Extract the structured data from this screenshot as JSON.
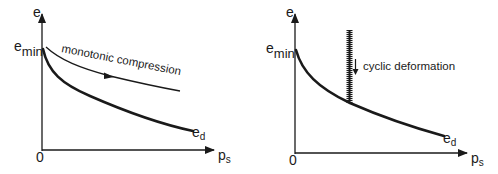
{
  "figure": {
    "panels": [
      {
        "id": "monotonic",
        "y_axis_label": "e",
        "x_axis_label_main": "p",
        "x_axis_label_sub": "s",
        "origin_label": "0",
        "upper_bound_label_main": "e",
        "upper_bound_label_sub": "min",
        "lower_curve_label_main": "e",
        "lower_curve_label_sub": "d",
        "annotation": "monotonic compression"
      },
      {
        "id": "cyclic",
        "y_axis_label": "e",
        "x_axis_label_main": "p",
        "x_axis_label_sub": "s",
        "origin_label": "0",
        "upper_bound_label_main": "e",
        "upper_bound_label_sub": "min",
        "lower_curve_label_main": "e",
        "lower_curve_label_sub": "d",
        "annotation": "cyclic deformation"
      }
    ],
    "colors": {
      "ink": "#1a1a1a",
      "background": "#ffffff"
    }
  }
}
